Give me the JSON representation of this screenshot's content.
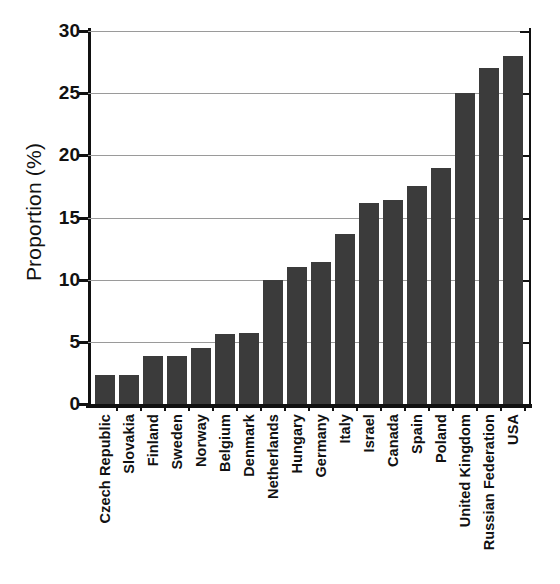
{
  "chart_data": {
    "type": "bar",
    "title": "",
    "subtitle": "",
    "xlabel": "",
    "ylabel": "Proportion (%)",
    "ylim": [
      0,
      30
    ],
    "yticks": [
      0,
      5,
      10,
      15,
      20,
      25,
      30
    ],
    "ytick_labels": [
      "0",
      "5",
      "10",
      "15",
      "20",
      "25",
      "30"
    ],
    "grid": true,
    "legend": false,
    "legend_position": "none",
    "bar_color": "#3b3b3b",
    "axis_color": "#111111",
    "gridline_color": "#9a9a9a",
    "background_color": "#ffffff",
    "categories": [
      "Czech Republic",
      "Slovakia",
      "Finland",
      "Sweden",
      "Norway",
      "Belgium",
      "Denmark",
      "Netherlands",
      "Hungary",
      "Germany",
      "Italy",
      "Israel",
      "Canada",
      "Spain",
      "Poland",
      "United Kingdom",
      "Russian Federation",
      "USA"
    ],
    "values": [
      2.3,
      2.3,
      3.9,
      3.9,
      4.5,
      5.6,
      5.7,
      10.0,
      11.0,
      11.4,
      13.7,
      16.2,
      16.4,
      17.5,
      19.0,
      25.0,
      27.0,
      28.0
    ]
  }
}
